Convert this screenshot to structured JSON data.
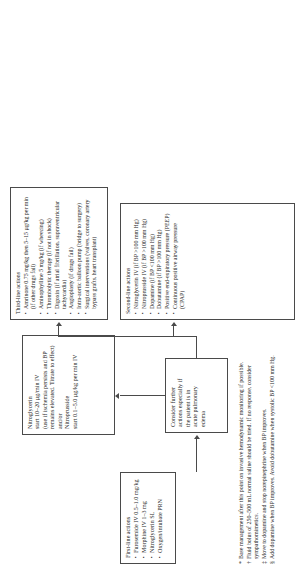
{
  "diagram": {
    "orientation": "rotated-90-ccw",
    "line_color": "#4a4a4a",
    "background": "#ffffff"
  },
  "nodes": {
    "first_line": {
      "heading": "First-line actions",
      "items": [
        "Furosemide IV 0.5–1.0 mg/kg",
        "Morphine IV 1–3 mg",
        "Nitroglycerin SL",
        "Oxygen/intubate PRN"
      ]
    },
    "nitroglycerin": {
      "lines": [
        "Nitroglycerin",
        "start 10–20 µg/min IV",
        "(use if ischemia persists and BP",
        "remains elevated. Titrate to effect)",
        "and/or",
        "Nitroprusside",
        "start 0.1–5.0 µg/kg per min IV"
      ]
    },
    "consider": {
      "lines": [
        "Consider further",
        "actions especially if",
        "the patient is in",
        "acute pulmonary",
        "edema"
      ]
    },
    "second_line": {
      "heading": "Second-line actions",
      "items": [
        "Nitroglycerin IV (if BP >100 mm Hg)",
        "Nitroprusside IV (if BP >100 mm Hg)",
        "Dopamine (if BP <100 mm Hg)",
        "Dobutamine (if BP >100 mm Hg)",
        "Positive end-expiratory pressure (PEEP)",
        "Continuous positive airway pressure (CPAP)"
      ]
    },
    "third_line": {
      "heading": "Third-line actions",
      "items": [
        "Amrinone 0.75 mg/kg then 5–15 µg/kg per min (if other drugs fail)",
        "Aminophylline 5 mg/kg (if wheezing)",
        "Thrombolytic therapy (if not in shock)",
        "Digoxin (if atrial fibrillation, supraventricular tachycardia)",
        "Angioplasty (if drugs fail)",
        "Intra-aortic balloon pump (bridge to surgery)",
        "Surgical interventions (valves, coronary artery bypass grafts, heart transplant)"
      ]
    }
  },
  "footnotes": [
    {
      "marker": "*",
      "text": "Base management after this point on invasive hemodynamic monitoring if possible."
    },
    {
      "marker": "†",
      "text": "Fluid bolus of 250–500 mL normal saline should be tried. If no response, consider sympathomimetics."
    },
    {
      "marker": "‡",
      "text": "Move to dopamine and stop norepinephrine when BP improves."
    },
    {
      "marker": "§",
      "text": "Add dopamine when BP improves. Avoid dobutamine when systolic BP <100 mm Hg."
    }
  ]
}
